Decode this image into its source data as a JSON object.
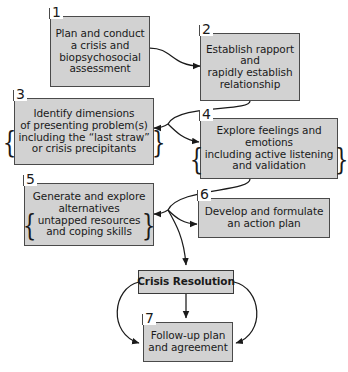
{
  "diagram": {
    "box_fill": "#d2d2d2",
    "box_border": "#4a4a4a",
    "line_color": "#1a1a1a",
    "background": "#ffffff",
    "nodes": [
      {
        "number": "1",
        "lines": [
          "Plan and conduct",
          "a crisis and",
          "biopsychosocial",
          "assessment"
        ],
        "braced_lines": []
      },
      {
        "number": "2",
        "lines": [
          "Establish rapport",
          "and",
          "rapidly establish",
          "relationship"
        ],
        "braced_lines": []
      },
      {
        "number": "3",
        "lines": [
          "Identify dimensions",
          "of presenting problem(s)"
        ],
        "braced_lines": [
          "including the “last straw”",
          "or crisis precipitants"
        ]
      },
      {
        "number": "4",
        "lines": [
          "Explore feelings and",
          "emotions"
        ],
        "braced_lines": [
          "including active listening",
          "and validation"
        ]
      },
      {
        "number": "5",
        "lines": [
          "Generate and explore",
          "alternatives"
        ],
        "braced_lines": [
          "untapped resources",
          "and coping skills"
        ]
      },
      {
        "number": "6",
        "lines": [
          "Develop and formulate",
          "an action plan"
        ],
        "braced_lines": []
      },
      {
        "number": "7",
        "lines": [
          "Follow-up plan",
          "and agreement"
        ],
        "braced_lines": []
      }
    ],
    "resolution": {
      "label": "Crisis Resolution"
    },
    "brace_open": "{",
    "brace_close": "}"
  }
}
